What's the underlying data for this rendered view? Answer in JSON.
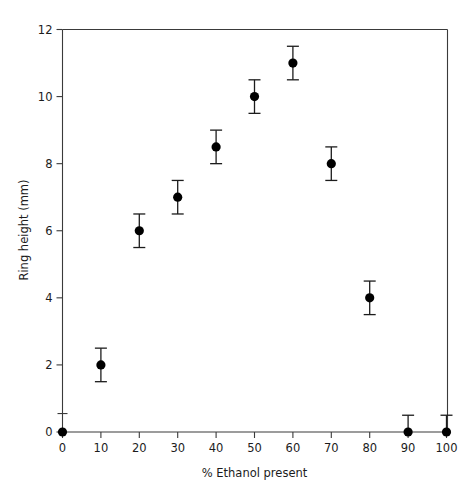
{
  "chart_data": {
    "type": "scatter",
    "title": "",
    "xlabel": "% Ethanol present",
    "ylabel": "Ring height (mm)",
    "xlim": [
      0,
      100
    ],
    "ylim": [
      0,
      12
    ],
    "xticks": [
      0,
      10,
      20,
      30,
      40,
      50,
      60,
      70,
      80,
      90,
      100
    ],
    "xtick_labels": [
      "0",
      "10",
      "20",
      "30",
      "40",
      "50",
      "60",
      "70",
      "80",
      "90",
      "100"
    ],
    "yticks": [
      0,
      2,
      4,
      6,
      8,
      10,
      12
    ],
    "ytick_labels": [
      "0",
      "2",
      "4",
      "6",
      "8",
      "10",
      "12"
    ],
    "grid": false,
    "legend": "none",
    "marker_color": "#000000",
    "axis_color": "#3a3a3a",
    "errorbar_color": "#1c1c1c",
    "x": [
      0,
      10,
      20,
      30,
      40,
      50,
      60,
      70,
      80,
      90,
      100
    ],
    "y": [
      0,
      2,
      6,
      7,
      8.5,
      10,
      11,
      8,
      4,
      0,
      0
    ],
    "yerr_lower": [
      0,
      0.5,
      0.5,
      0.5,
      0.5,
      0.5,
      0.5,
      0.5,
      0.5,
      0,
      0
    ],
    "yerr_upper": [
      0,
      0.5,
      0.5,
      0.5,
      0.5,
      0.5,
      0.5,
      0.5,
      0.5,
      0.5,
      0.5
    ],
    "points": [
      {
        "x": 0,
        "y": 0,
        "err_low": 0,
        "err_high": 0
      },
      {
        "x": 10,
        "y": 2,
        "err_low": 0.5,
        "err_high": 0.5
      },
      {
        "x": 20,
        "y": 6,
        "err_low": 0.5,
        "err_high": 0.5
      },
      {
        "x": 30,
        "y": 7,
        "err_low": 0.5,
        "err_high": 0.5
      },
      {
        "x": 40,
        "y": 8.5,
        "err_low": 0.5,
        "err_high": 0.5
      },
      {
        "x": 50,
        "y": 10,
        "err_low": 0.5,
        "err_high": 0.5
      },
      {
        "x": 60,
        "y": 11,
        "err_low": 0.5,
        "err_high": 0.5
      },
      {
        "x": 70,
        "y": 8,
        "err_low": 0.5,
        "err_high": 0.5
      },
      {
        "x": 80,
        "y": 4,
        "err_low": 0.5,
        "err_high": 0.5
      },
      {
        "x": 90,
        "y": 0,
        "err_low": 0,
        "err_high": 0.5
      },
      {
        "x": 100,
        "y": 0,
        "err_low": 0,
        "err_high": 0.5
      }
    ]
  }
}
